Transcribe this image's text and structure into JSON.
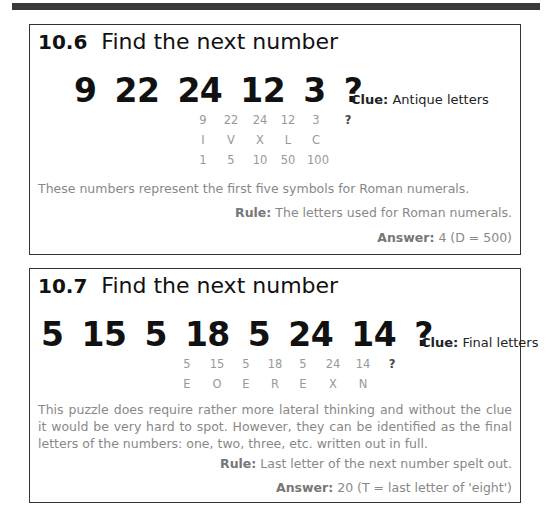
{
  "puzzles": [
    {
      "number": "10.6",
      "title": "Find the next number",
      "sequence": [
        "9",
        "22",
        "24",
        "12",
        "3",
        "?"
      ],
      "clue_label": "Clue:",
      "clue_text": "Antique letters",
      "working": {
        "row1": [
          "9",
          "22",
          "24",
          "12",
          "3",
          "?"
        ],
        "row2": [
          "I",
          "V",
          "X",
          "L",
          "C"
        ],
        "row3": [
          "1",
          "5",
          "10",
          "50",
          "100"
        ]
      },
      "explanation": "These numbers represent the first five symbols for Roman numerals.",
      "rule_label": "Rule:",
      "rule_text": "The letters used for Roman numerals.",
      "answer_label": "Answer:",
      "answer_text": "4 (D = 500)"
    },
    {
      "number": "10.7",
      "title": "Find the next number",
      "sequence": [
        "5",
        "15",
        "5",
        "18",
        "5",
        "24",
        "14",
        "?"
      ],
      "clue_label": "Clue:",
      "clue_text": "Final letters",
      "working": {
        "row1": [
          "5",
          "15",
          "5",
          "18",
          "5",
          "24",
          "14",
          "?"
        ],
        "row2": [
          "E",
          "O",
          "E",
          "R",
          "E",
          "X",
          "N"
        ]
      },
      "explanation": "This puzzle does require rather more lateral thinking and without the clue it would be very hard to spot.  However, they can be identified as the final letters of the  numbers: one, two, three, etc. written out in full.",
      "rule_label": "Rule:",
      "rule_text": "Last letter of the next number spelt out.",
      "answer_label": "Answer:",
      "answer_text": "20 (T = last letter of 'eight')"
    }
  ]
}
